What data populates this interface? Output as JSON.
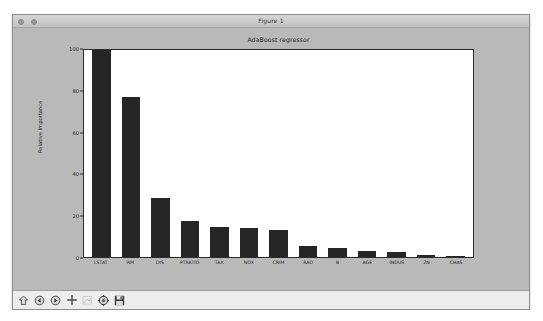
{
  "window": {
    "title": "Figure 1",
    "controls": [
      "window-dot-1",
      "window-dot-2"
    ]
  },
  "toolbar": {
    "buttons": [
      {
        "name": "home-icon",
        "tooltip": "Home",
        "enabled": true
      },
      {
        "name": "back-arrow-icon",
        "tooltip": "Back",
        "enabled": true
      },
      {
        "name": "forward-arrow-icon",
        "tooltip": "Forward",
        "enabled": true
      },
      {
        "name": "pan-move-icon",
        "tooltip": "Pan",
        "enabled": true
      },
      {
        "name": "zoom-rect-icon",
        "tooltip": "Zoom to rectangle",
        "enabled": false
      },
      {
        "name": "configure-subplots-icon",
        "tooltip": "Configure subplots",
        "enabled": true
      },
      {
        "name": "save-figure-icon",
        "tooltip": "Save the figure",
        "enabled": true
      }
    ]
  },
  "chart_data": {
    "type": "bar",
    "title": "AdaBoost regressor",
    "xlabel": "",
    "ylabel": "Relative Importance",
    "categories": [
      "LSTAT",
      "RM",
      "DIS",
      "PTRATIO",
      "TAX",
      "NOX",
      "CRIM",
      "RAD",
      "B",
      "AGE",
      "INDUS",
      "ZN",
      "CHAS"
    ],
    "values": [
      100.0,
      77.5,
      28.5,
      17.5,
      14.5,
      14.0,
      13.0,
      5.5,
      4.5,
      3.0,
      2.5,
      1.2,
      0.6
    ],
    "ylim": [
      0,
      100
    ],
    "yticks": [
      0,
      20,
      40,
      60,
      80,
      100
    ],
    "ytick_labels": [
      "0",
      "20",
      "40",
      "60",
      "80",
      "100"
    ],
    "grid": false,
    "legend": null,
    "bar_color": "#262626"
  }
}
